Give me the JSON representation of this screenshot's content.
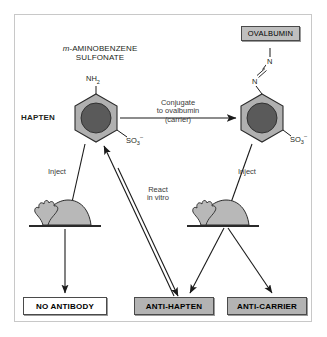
{
  "figure": {
    "title_line1": "m-AMINOBENZENE",
    "title_line1_italic_prefix": "m",
    "title_line2": "SULFONATE"
  },
  "molecules": {
    "hapten_label": "HAPTEN",
    "amine_group": "NH",
    "amine_subscript": "2",
    "sulfonate_group": "SO",
    "sulfonate_subscript": "3",
    "sulfonate_charge": "–",
    "azo_nitrogen_top": "N",
    "azo_nitrogen_bottom": "N",
    "carrier_label": "OVALBUMIN"
  },
  "arrows": {
    "conjugate_line1": "Conjugate",
    "conjugate_line2": "to ovalbumin",
    "conjugate_line3": "(carrier)",
    "inject_left": "Inject",
    "inject_right": "Inject",
    "react_line1": "React",
    "react_line2": "in vitro"
  },
  "outcomes": [
    {
      "label": "NO ANTIBODY",
      "style": "white"
    },
    {
      "label": "ANTI-HAPTEN",
      "style": "grey"
    },
    {
      "label": "ANTI-CARRIER",
      "style": "grey"
    }
  ],
  "colors": {
    "ring_outer": "#b0b0b0",
    "ring_core": "#5a5a5a",
    "animal_body": "#b8b8b8",
    "box_grey": "#b3b3b3",
    "line": "#1a1a1a",
    "frame": "#c8c8c8"
  }
}
